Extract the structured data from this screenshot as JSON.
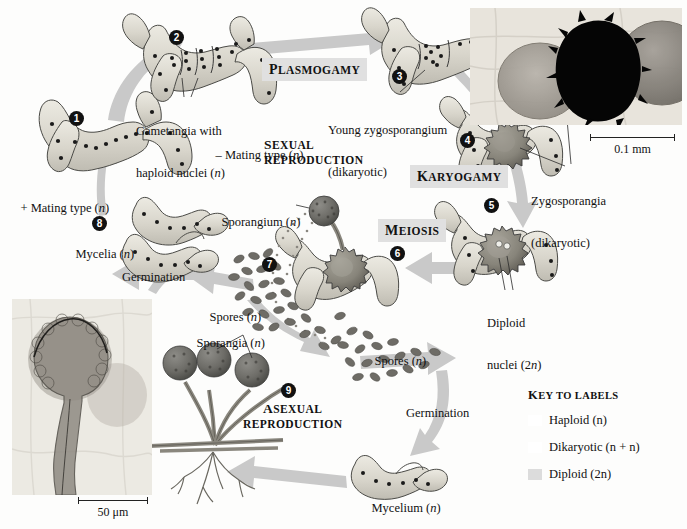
{
  "figure": {
    "background_color": "#fdfdfc",
    "arrow_color": "#c9c9c9",
    "hypha_fill": "#d6d4cc",
    "outline_color": "#3a3a3a"
  },
  "stage_headings": [
    {
      "id": "plasmogamy",
      "text": "PLASMOGAMY",
      "first": "P",
      "rest": "LASMOGAMY",
      "boxed": true
    },
    {
      "id": "karyogamy",
      "text": "KARYOGAMY",
      "first": "K",
      "rest": "ARYOGAMY",
      "boxed": true
    },
    {
      "id": "meiosis",
      "text": "MEIOSIS",
      "first": "M",
      "rest": "EIOSIS",
      "boxed": true
    }
  ],
  "section_titles": {
    "sexual_line1_first": "S",
    "sexual_line1_rest": "EXUAL",
    "sexual_line2": "REPRODUCTION",
    "asexual_line1_first": "A",
    "asexual_line1_rest": "SEXUAL",
    "asexual_line2": "REPRODUCTION"
  },
  "step_numbers": [
    {
      "n": "1",
      "glyph": "❶"
    },
    {
      "n": "2",
      "glyph": "❷"
    },
    {
      "n": "3",
      "glyph": "❸"
    },
    {
      "n": "4",
      "glyph": "❹"
    },
    {
      "n": "5",
      "glyph": "❺"
    },
    {
      "n": "6",
      "glyph": "❻"
    },
    {
      "n": "7",
      "glyph": "❼"
    },
    {
      "n": "8",
      "glyph": "❽"
    },
    {
      "n": "9",
      "glyph": "❾"
    }
  ],
  "labels": {
    "gametangia": {
      "line1": "Gametangia with",
      "line2_pre": "haploid nuclei (",
      "line2_it": "n",
      "line2_post": ")"
    },
    "young_zygosporangium": {
      "line1": "Young zygosporangium",
      "line2": "(dikaryotic)"
    },
    "zygosporangia": {
      "line1": "Zygosporangia",
      "line2": "(dikaryotic)"
    },
    "minus_mating": {
      "pre": "– Mating type (",
      "it": "n",
      "post": ")"
    },
    "plus_mating": {
      "pre": "+ Mating type (",
      "it": "n",
      "post": ")"
    },
    "mycelia": {
      "pre": "Mycelia (",
      "it": "n",
      "post": ")"
    },
    "germination_left": "Germination",
    "germination_right": "Germination",
    "sporangium": {
      "pre": "Sporangium (",
      "it": "n",
      "post": ")"
    },
    "sporangia": {
      "pre": "Sporangia (",
      "it": "n",
      "post": ")"
    },
    "spores_left": {
      "pre": "Spores (",
      "it": "n",
      "post": ")"
    },
    "spores_right": {
      "pre": "Spores (",
      "it": "n",
      "post": ")"
    },
    "diploid_nuclei": {
      "line1": "Diploid",
      "line2_pre": "nuclei (2",
      "line2_it": "n",
      "line2_post": ")"
    },
    "mycelium": {
      "pre": "Mycelium (",
      "it": "n",
      "post": ")"
    }
  },
  "key": {
    "title_cap": "K",
    "title_rest": "EY TO LABELS",
    "items": [
      {
        "label_pre": "Haploid (",
        "label_it": "n",
        "label_post": ")",
        "swatch": "#ffffff",
        "swatch_visible": false
      },
      {
        "label_pre": "Dikaryotic (",
        "label_it": "n + n",
        "label_post": ")",
        "swatch": "#ffffff",
        "swatch_visible": false
      },
      {
        "label_pre": "Diploid (2",
        "label_it": "n",
        "label_post": ")",
        "swatch": "#dcdcdc",
        "swatch_visible": true
      }
    ]
  },
  "micrographs": [
    {
      "id": "zygosporangia-micrograph",
      "position": "top-right",
      "scale_value": "0.1 mm"
    },
    {
      "id": "sporangium-micrograph",
      "position": "bottom-left",
      "scale_value": "50 μm"
    }
  ]
}
